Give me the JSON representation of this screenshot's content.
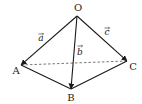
{
  "diagram": {
    "type": "tetrahedron-vectors",
    "points": {
      "O": {
        "label": "O",
        "x": 77,
        "y": 16,
        "lx": 78,
        "ly": 11
      },
      "A": {
        "label": "A",
        "x": 21,
        "y": 65,
        "lx": 16,
        "ly": 74
      },
      "B": {
        "label": "B",
        "x": 71,
        "y": 89,
        "lx": 71,
        "ly": 101
      },
      "C": {
        "label": "C",
        "x": 127,
        "y": 61,
        "lx": 133,
        "ly": 70
      }
    },
    "vectors": [
      {
        "name": "a",
        "label": "a",
        "from": "O",
        "to": "A",
        "lx": 41,
        "ly": 41
      },
      {
        "name": "b",
        "label": "b",
        "from": "O",
        "to": "B",
        "lx": 80,
        "ly": 55
      },
      {
        "name": "c",
        "label": "c",
        "from": "O",
        "to": "C",
        "lx": 107,
        "ly": 35
      }
    ],
    "solid_edges": [
      [
        "A",
        "B"
      ],
      [
        "B",
        "C"
      ]
    ],
    "dashed_edges": [
      [
        "A",
        "C"
      ]
    ],
    "colors": {
      "line": "#1a1a1a",
      "dashed": "#555555",
      "background": "#ffffff"
    }
  }
}
